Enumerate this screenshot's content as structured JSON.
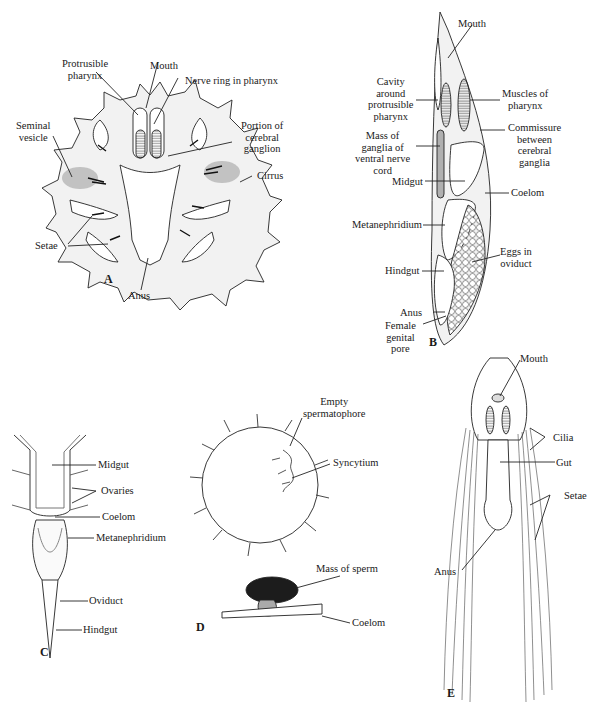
{
  "figure": {
    "panels": [
      {
        "id": "A",
        "letter": "A",
        "labels": {
          "protrusible_pharynx": "Protrusible\npharynx",
          "mouth": "Mouth",
          "nerve_ring": "Nerve ring in pharynx",
          "seminal_vesicle": "Seminal\nvesicle",
          "cerebral_ganglion": "Portion of\ncerebral\nganglion",
          "cirrus": "Cirrus",
          "setae": "Setae",
          "anus": "Anus"
        }
      },
      {
        "id": "B",
        "letter": "B",
        "labels": {
          "mouth": "Mouth",
          "cavity": "Cavity\naround\nprotrusible\npharynx",
          "muscles": "Muscles of\npharynx",
          "commissure": "Commissure\nbetween\ncerebral\nganglia",
          "ganglia": "Mass of\nganglia of\nventral nerve\ncord",
          "midgut": "Midgut",
          "coelom": "Coelom",
          "metanephridium": "Metanephridium",
          "eggs": "Eggs in\noviduct",
          "hindgut": "Hindgut",
          "anus": "Anus",
          "female_pore": "Female\ngenital\npore"
        }
      },
      {
        "id": "C",
        "letter": "C",
        "labels": {
          "midgut": "Midgut",
          "ovaries": "Ovaries",
          "coelom": "Coelom",
          "metanephridium": "Metanephridium",
          "oviduct": "Oviduct",
          "hindgut": "Hindgut"
        }
      },
      {
        "id": "D",
        "letter": "D",
        "labels": {
          "empty_spermatophore": "Empty\nspermatophore",
          "syncytium": "Syncytium",
          "mass_of_sperm": "Mass of sperm",
          "coelom": "Coelom"
        }
      },
      {
        "id": "E",
        "letter": "E",
        "labels": {
          "mouth": "Mouth",
          "cilia": "Cilia",
          "gut": "Gut",
          "setae": "Setae",
          "anus": "Anus"
        }
      }
    ]
  }
}
